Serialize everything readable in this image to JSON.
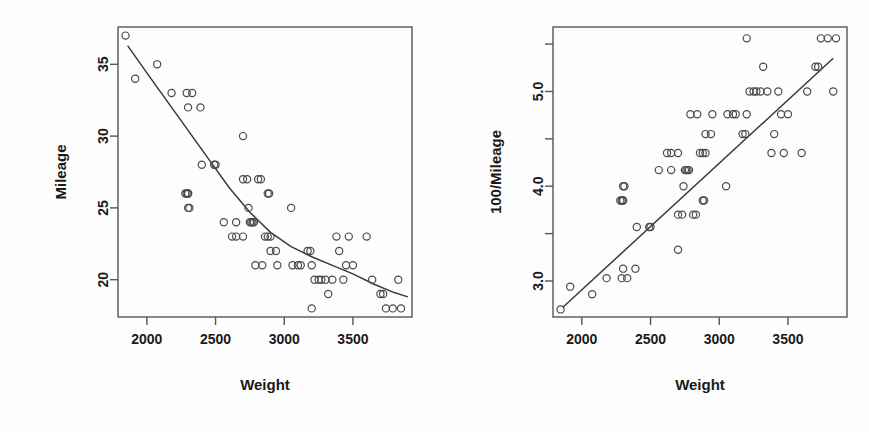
{
  "figure": {
    "background": "#fdfdfd",
    "point_color": "#4a4a4a",
    "line_color": "#3a3a3a",
    "frame_color": "#555555"
  },
  "chart_data": [
    {
      "type": "scatter",
      "panel": "left",
      "title": "",
      "xlabel": "Weight",
      "ylabel": "Mileage",
      "xlim": [
        1790,
        3930
      ],
      "ylim": [
        17.4,
        37.6
      ],
      "xticks": [
        2000,
        2500,
        3000,
        3500
      ],
      "xticklabels": [
        "2000",
        "2500",
        "3000",
        "3500"
      ],
      "yticks": [
        20,
        25,
        30,
        35
      ],
      "yticklabels": [
        "20",
        "25",
        "30",
        "35"
      ],
      "grid": false,
      "legend": "none",
      "marker": "open-circle",
      "fit": {
        "kind": "smooth-curve",
        "description": "monotone decreasing convex fit",
        "points": [
          [
            1860,
            36.3
          ],
          [
            2000,
            34.4
          ],
          [
            2150,
            32.4
          ],
          [
            2300,
            30.4
          ],
          [
            2450,
            28.4
          ],
          [
            2600,
            26.4
          ],
          [
            2750,
            24.7
          ],
          [
            2900,
            23.3
          ],
          [
            3050,
            22.3
          ],
          [
            3200,
            21.6
          ],
          [
            3350,
            21.0
          ],
          [
            3500,
            20.4
          ],
          [
            3650,
            19.7
          ],
          [
            3800,
            19.1
          ],
          [
            3900,
            18.8
          ]
        ]
      },
      "x": [
        1845,
        1915,
        2075,
        2180,
        2290,
        2300,
        2330,
        2390,
        2400,
        2300,
        2280,
        2490,
        2500,
        2560,
        2700,
        2290,
        2300,
        2310,
        2300,
        2650,
        2700,
        2730,
        2740,
        2810,
        2830,
        2880,
        2890,
        2900,
        2700,
        2760,
        2770,
        2780,
        2620,
        2650,
        2860,
        2880,
        2900,
        2950,
        3050,
        3060,
        3170,
        3190,
        3200,
        3200,
        3220,
        3250,
        3270,
        3300,
        3320,
        3350,
        3380,
        3400,
        3430,
        3450,
        3470,
        3500,
        3600,
        3640,
        3700,
        3720,
        3740,
        3790,
        3830,
        3850,
        2750,
        2790,
        2840,
        3100,
        3120,
        2940
      ],
      "y": [
        37,
        34,
        35,
        33,
        33,
        32,
        33,
        32,
        28,
        26,
        26,
        28,
        28,
        24,
        30,
        26,
        26,
        25,
        25,
        24,
        27,
        27,
        25,
        27,
        27,
        26,
        26,
        23,
        23,
        24,
        24,
        24,
        23,
        23,
        23,
        23,
        22,
        21,
        25,
        21,
        22,
        22,
        21,
        18,
        20,
        20,
        20,
        20,
        19,
        20,
        23,
        22,
        20,
        21,
        23,
        21,
        23,
        20,
        19,
        19,
        18,
        18,
        20,
        18,
        24,
        21,
        21,
        21,
        21,
        22
      ]
    },
    {
      "type": "scatter",
      "panel": "right",
      "title": "",
      "xlabel": "Weight",
      "ylabel": "100/Mileage",
      "xlim": [
        1790,
        3930
      ],
      "ylim": [
        2.62,
        5.68
      ],
      "xticks": [
        2000,
        2500,
        3000,
        3500
      ],
      "xticklabels": [
        "2000",
        "2500",
        "3000",
        "3500"
      ],
      "yticks": [
        3.0,
        3.5,
        4.0,
        4.5,
        5.0,
        5.5
      ],
      "yticklabels": [
        "3.0",
        "",
        "4.0",
        "",
        "5.0",
        ""
      ],
      "ylabeled_ticks": [
        3.0,
        4.0,
        5.0
      ],
      "grid": false,
      "legend": "none",
      "marker": "open-circle",
      "fit": {
        "kind": "straight-line",
        "description": "increasing linear fit",
        "points": [
          [
            1860,
            2.72
          ],
          [
            3830,
            5.35
          ]
        ]
      },
      "x": [
        1845,
        1915,
        2075,
        2180,
        2290,
        2300,
        2330,
        2390,
        2400,
        2300,
        2280,
        2490,
        2500,
        2560,
        2700,
        2290,
        2300,
        2310,
        2300,
        2650,
        2700,
        2730,
        2740,
        2810,
        2830,
        2880,
        2890,
        2900,
        2700,
        2760,
        2770,
        2780,
        2620,
        2650,
        2860,
        2880,
        2900,
        2950,
        3050,
        3060,
        3170,
        3190,
        3200,
        3200,
        3220,
        3250,
        3270,
        3300,
        3320,
        3350,
        3380,
        3400,
        3430,
        3450,
        3470,
        3500,
        3600,
        3640,
        3700,
        3720,
        3740,
        3790,
        3830,
        3850,
        2750,
        2790,
        2840,
        3100,
        3120,
        2940
      ],
      "y": [
        2.7,
        2.94,
        2.86,
        3.03,
        3.03,
        3.13,
        3.03,
        3.13,
        3.57,
        3.85,
        3.85,
        3.57,
        3.57,
        4.17,
        3.33,
        3.85,
        3.85,
        4.0,
        4.0,
        4.17,
        3.7,
        3.7,
        4.0,
        3.7,
        3.7,
        3.85,
        3.85,
        4.35,
        4.35,
        4.17,
        4.17,
        4.17,
        4.35,
        4.35,
        4.35,
        4.35,
        4.55,
        4.76,
        4.0,
        4.76,
        4.55,
        4.55,
        4.76,
        5.56,
        5.0,
        5.0,
        5.0,
        5.0,
        5.26,
        5.0,
        4.35,
        4.55,
        5.0,
        4.76,
        4.35,
        4.76,
        4.35,
        5.0,
        5.26,
        5.26,
        5.56,
        5.56,
        5.0,
        5.56,
        4.17,
        4.76,
        4.76,
        4.76,
        4.76,
        4.55
      ]
    }
  ]
}
